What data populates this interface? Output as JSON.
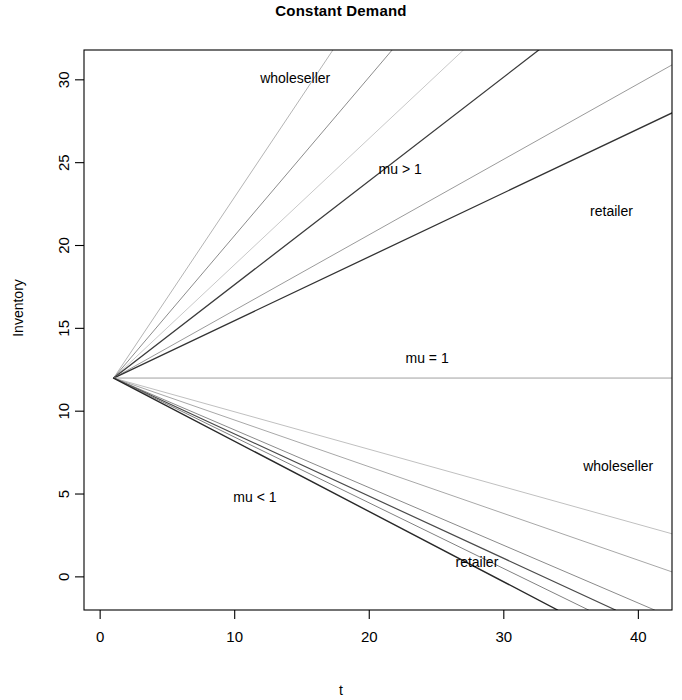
{
  "chart_data": {
    "type": "line",
    "title": "Constant Demand",
    "xlabel": "t",
    "ylabel": "Inventory",
    "xlim": [
      -1.2,
      42.5
    ],
    "ylim": [
      -2.0,
      31.8
    ],
    "xticks": [
      0,
      10,
      20,
      30,
      40
    ],
    "yticks": [
      0,
      5,
      10,
      15,
      20,
      25,
      30
    ],
    "grid": false,
    "legend": "none",
    "start_point": {
      "t": 1,
      "inventory": 12
    },
    "annotations": [
      {
        "text": "wholeseller",
        "t": 14.5,
        "inventory": 30.1
      },
      {
        "text": "mu > 1",
        "t": 22.3,
        "inventory": 24.6
      },
      {
        "text": "retailer",
        "t": 38.0,
        "inventory": 22.1
      },
      {
        "text": "mu = 1",
        "t": 24.3,
        "inventory": 13.2
      },
      {
        "text": "wholeseller",
        "t": 38.5,
        "inventory": 6.7
      },
      {
        "text": "mu < 1",
        "t": 11.5,
        "inventory": 4.8
      },
      {
        "text": "retailer",
        "t": 28.0,
        "inventory": 0.9
      }
    ],
    "series": [
      {
        "name": "mu > 1 wholeseller a",
        "group": "upper",
        "role": "wholeseller",
        "mu": 1.58,
        "color": "#b4b4b4",
        "width": 1.0,
        "x": [
          1,
          17.3
        ],
        "y": [
          12,
          31.8
        ]
      },
      {
        "name": "mu > 1 wholeseller b",
        "group": "upper",
        "role": "wholeseller",
        "mu": 1.45,
        "color": "#8c8c8c",
        "width": 1.0,
        "x": [
          1,
          21.7
        ],
        "y": [
          12,
          31.8
        ]
      },
      {
        "name": "mu > 1 wholeseller c",
        "group": "upper",
        "role": "wholeseller",
        "mu": 1.36,
        "color": "#c8c8c8",
        "width": 1.0,
        "x": [
          1,
          27.0
        ],
        "y": [
          12,
          31.8
        ]
      },
      {
        "name": "mu > 1 retailer a",
        "group": "upper",
        "role": "retailer",
        "mu": 1.3,
        "color": "#3c3c3c",
        "width": 1.3,
        "x": [
          1,
          32.6
        ],
        "y": [
          12,
          31.8
        ]
      },
      {
        "name": "mu > 1 retailer b",
        "group": "upper",
        "role": "retailer",
        "mu": 1.23,
        "color": "#9b9b9b",
        "width": 1.0,
        "x": [
          1,
          42.5
        ],
        "y": [
          12,
          30.9
        ]
      },
      {
        "name": "mu > 1 retailer c",
        "group": "upper",
        "role": "retailer",
        "mu": 1.2,
        "color": "#323232",
        "width": 1.3,
        "x": [
          1,
          42.5
        ],
        "y": [
          12,
          28.0
        ]
      },
      {
        "name": "mu = 1 steady",
        "group": "flat",
        "role": "steady",
        "mu": 1.0,
        "color": "#a0a0a0",
        "width": 1.0,
        "x": [
          1,
          42.5
        ],
        "y": [
          12,
          12
        ]
      },
      {
        "name": "mu < 1 wholeseller a",
        "group": "lower",
        "role": "wholeseller",
        "mu": 0.78,
        "color": "#c0c0c0",
        "width": 1.0,
        "x": [
          1,
          42.5
        ],
        "y": [
          12,
          2.6
        ]
      },
      {
        "name": "mu < 1 wholeseller b",
        "group": "lower",
        "role": "wholeseller",
        "mu": 0.74,
        "color": "#a8a8a8",
        "width": 1.0,
        "x": [
          1,
          42.5
        ],
        "y": [
          12,
          0.3
        ]
      },
      {
        "name": "mu < 1 wholeseller c",
        "group": "lower",
        "role": "wholeseller",
        "mu": 0.7,
        "color": "#8a8a8a",
        "width": 1.0,
        "x": [
          1,
          41.2
        ],
        "y": [
          12,
          -2.0
        ]
      },
      {
        "name": "mu < 1 retailer a",
        "group": "lower",
        "role": "retailer",
        "mu": 0.66,
        "color": "#4a4a4a",
        "width": 1.2,
        "x": [
          1,
          38.3
        ],
        "y": [
          12,
          -2.0
        ]
      },
      {
        "name": "mu < 1 retailer b",
        "group": "lower",
        "role": "retailer",
        "mu": 0.62,
        "color": "#808080",
        "width": 1.0,
        "x": [
          1,
          36.3
        ],
        "y": [
          12,
          -2.0
        ]
      },
      {
        "name": "mu < 1 retailer c",
        "group": "lower",
        "role": "retailer",
        "mu": 0.58,
        "color": "#282828",
        "width": 1.4,
        "x": [
          1,
          34.0
        ],
        "y": [
          12,
          -2.0
        ]
      }
    ]
  }
}
